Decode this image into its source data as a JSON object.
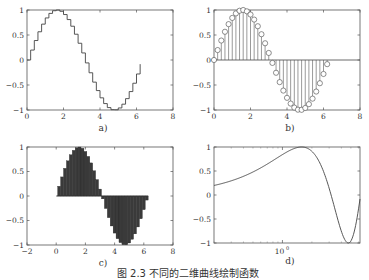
{
  "caption": "图 2.3  不同的二维曲线绘制函数",
  "chart_data": [
    {
      "id": "a",
      "type": "line",
      "style": "stairs",
      "label": "a)",
      "x_range": [
        0,
        8
      ],
      "y_range": [
        -1,
        1
      ],
      "xticks": [
        "0",
        "2",
        "4",
        "6",
        "8"
      ],
      "yticks": [
        "1",
        "0.5",
        "0",
        "-0.5",
        "-1"
      ],
      "function": "sin(x)",
      "x": "0:0.2:6.2",
      "grid": false
    },
    {
      "id": "b",
      "type": "scatter",
      "style": "stem",
      "label": "b)",
      "x_range": [
        0,
        8
      ],
      "y_range": [
        -1,
        1
      ],
      "xticks": [
        "0",
        "2",
        "4",
        "6",
        "8"
      ],
      "yticks": [
        "1",
        "0.5",
        "0",
        "-0.5",
        "-1"
      ],
      "function": "sin(x)",
      "x": "0:0.2:6.2",
      "marker": "circle",
      "grid": false
    },
    {
      "id": "c",
      "type": "bar",
      "style": "bar (filled, dark)",
      "label": "c)",
      "x_range": [
        -2,
        8
      ],
      "y_range": [
        -1,
        1
      ],
      "xticks": [
        "-2",
        "0",
        "2",
        "4",
        "6",
        "8"
      ],
      "yticks": [
        "1",
        "0.5",
        "0",
        "-0.5",
        "-1"
      ],
      "function": "sin(x)",
      "x": "0:0.2:6.2",
      "grid": false
    },
    {
      "id": "d",
      "type": "line",
      "style": "semilogx",
      "label": "d)",
      "x_range": [
        0.2,
        6.2
      ],
      "x_scale": "log",
      "y_range": [
        -1,
        1
      ],
      "xticks": [
        "10^0"
      ],
      "yticks": [
        "1",
        "0.5",
        "0",
        "-0.5",
        "-1"
      ],
      "function": "sin(x)",
      "grid": false
    }
  ],
  "labels": {
    "a": "a)",
    "b": "b)",
    "c": "c)",
    "d": "d)",
    "ten": "10",
    "zero_exp": "0"
  }
}
